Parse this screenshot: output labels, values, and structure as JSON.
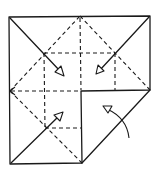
{
  "diagram": {
    "type": "origami-fold-diagram",
    "colors": {
      "line": "#1a1a1a",
      "background": "#ffffff"
    },
    "outline": {
      "top_left": [
        9,
        17
      ],
      "top_right": [
        150,
        16
      ],
      "right_mid": [
        150,
        90
      ],
      "center": [
        81,
        91
      ],
      "bottom_mid": [
        82,
        163
      ],
      "bottom_left": [
        10,
        164
      ]
    },
    "fold_arrows": [
      {
        "name": "top-left-corner-arrow",
        "from": [
          10,
          18
        ],
        "via": [
          44,
          53
        ],
        "tip": [
          64,
          76
        ]
      },
      {
        "name": "top-right-corner-arrow",
        "from": [
          149,
          17
        ],
        "via": [
          115,
          53
        ],
        "tip": [
          96,
          74
        ]
      },
      {
        "name": "bottom-left-corner-arrow",
        "from": [
          11,
          163
        ],
        "via": [
          45,
          128
        ],
        "tip": [
          63,
          112
        ]
      }
    ],
    "curved_arrow": {
      "start": [
        129,
        138
      ],
      "control": [
        123,
        116
      ],
      "tip": [
        103,
        106
      ]
    },
    "icons": [
      "valley-fold-line",
      "fold-arrow",
      "curved-flip-arrow"
    ]
  }
}
